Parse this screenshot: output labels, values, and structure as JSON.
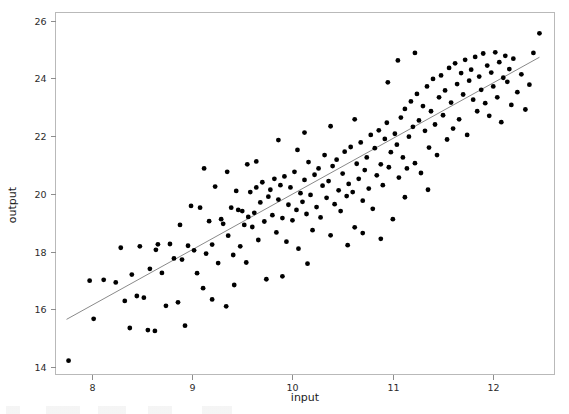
{
  "figure": {
    "width": 569,
    "height": 414,
    "background": "#ffffff",
    "point_color": "#000000",
    "line_color": "#8a8a8a",
    "frame_color": "#b9b9b9"
  },
  "chart_data": {
    "type": "scatter",
    "title": "",
    "xlabel": "input",
    "ylabel": "output",
    "xlim": [
      7.64,
      12.61
    ],
    "ylim": [
      13.74,
      26.28
    ],
    "xticks": [
      8,
      9,
      10,
      11,
      12
    ],
    "yticks": [
      14,
      16,
      18,
      20,
      22,
      24,
      26
    ],
    "xtick_labels": [
      "8",
      "9",
      "10",
      "11",
      "12"
    ],
    "ytick_labels": [
      "14",
      "16",
      "18",
      "20",
      "22",
      "24",
      "26"
    ],
    "grid": false,
    "legend": null,
    "n_points": 200,
    "fit_line": {
      "type": "linear",
      "x_start": 7.75,
      "y_start": 15.65,
      "x_end": 12.46,
      "y_end": 24.73,
      "slope": 1.929,
      "intercept": 0.705
    },
    "points": [
      [
        7.77,
        14.22
      ],
      [
        7.98,
        16.99
      ],
      [
        8.02,
        15.67
      ],
      [
        8.12,
        17.02
      ],
      [
        8.24,
        16.93
      ],
      [
        8.29,
        18.13
      ],
      [
        8.33,
        16.29
      ],
      [
        8.38,
        15.35
      ],
      [
        8.4,
        17.2
      ],
      [
        8.45,
        16.46
      ],
      [
        8.48,
        18.18
      ],
      [
        8.52,
        16.4
      ],
      [
        8.56,
        15.28
      ],
      [
        8.58,
        17.4
      ],
      [
        8.63,
        15.25
      ],
      [
        8.66,
        18.25
      ],
      [
        8.7,
        17.26
      ],
      [
        8.74,
        16.12
      ],
      [
        8.78,
        18.26
      ],
      [
        8.82,
        17.76
      ],
      [
        8.86,
        16.24
      ],
      [
        8.9,
        17.72
      ],
      [
        8.93,
        15.43
      ],
      [
        8.96,
        18.2
      ],
      [
        8.99,
        19.58
      ],
      [
        9.02,
        18.04
      ],
      [
        9.05,
        17.25
      ],
      [
        9.08,
        19.52
      ],
      [
        9.11,
        16.73
      ],
      [
        9.14,
        17.93
      ],
      [
        9.17,
        19.05
      ],
      [
        9.2,
        18.24
      ],
      [
        9.23,
        20.25
      ],
      [
        9.26,
        17.6
      ],
      [
        9.29,
        19.12
      ],
      [
        9.31,
        18.96
      ],
      [
        9.34,
        16.1
      ],
      [
        9.36,
        18.55
      ],
      [
        9.39,
        19.52
      ],
      [
        9.41,
        17.88
      ],
      [
        9.44,
        20.1
      ],
      [
        9.46,
        19.44
      ],
      [
        9.48,
        18.18
      ],
      [
        9.5,
        19.4
      ],
      [
        9.52,
        18.92
      ],
      [
        9.54,
        17.62
      ],
      [
        9.56,
        19.2
      ],
      [
        9.58,
        20.06
      ],
      [
        9.6,
        18.85
      ],
      [
        9.62,
        19.34
      ],
      [
        9.64,
        20.22
      ],
      [
        9.66,
        18.4
      ],
      [
        9.68,
        19.7
      ],
      [
        9.7,
        20.4
      ],
      [
        9.72,
        19.04
      ],
      [
        9.74,
        17.04
      ],
      [
        9.76,
        19.9
      ],
      [
        9.78,
        20.14
      ],
      [
        9.8,
        19.26
      ],
      [
        9.82,
        20.52
      ],
      [
        9.84,
        18.66
      ],
      [
        9.86,
        19.8
      ],
      [
        9.88,
        20.3
      ],
      [
        9.9,
        19.16
      ],
      [
        9.92,
        20.6
      ],
      [
        9.94,
        18.34
      ],
      [
        9.96,
        19.62
      ],
      [
        9.98,
        20.22
      ],
      [
        10.0,
        19.08
      ],
      [
        10.02,
        20.76
      ],
      [
        10.04,
        19.44
      ],
      [
        10.06,
        18.1
      ],
      [
        10.08,
        20.02
      ],
      [
        10.1,
        19.72
      ],
      [
        10.12,
        20.48
      ],
      [
        10.14,
        19.3
      ],
      [
        10.16,
        21.1
      ],
      [
        10.18,
        19.96
      ],
      [
        10.2,
        18.74
      ],
      [
        10.22,
        20.66
      ],
      [
        10.24,
        19.54
      ],
      [
        10.26,
        20.88
      ],
      [
        10.28,
        19.18
      ],
      [
        10.3,
        20.28
      ],
      [
        10.32,
        21.34
      ],
      [
        10.34,
        19.86
      ],
      [
        10.36,
        20.44
      ],
      [
        10.38,
        18.56
      ],
      [
        10.4,
        20.96
      ],
      [
        10.42,
        19.64
      ],
      [
        10.44,
        21.18
      ],
      [
        10.46,
        20.12
      ],
      [
        10.48,
        19.4
      ],
      [
        10.5,
        20.7
      ],
      [
        10.52,
        21.46
      ],
      [
        10.54,
        19.92
      ],
      [
        10.56,
        20.34
      ],
      [
        10.58,
        21.62
      ],
      [
        10.6,
        20.06
      ],
      [
        10.62,
        18.84
      ],
      [
        10.64,
        21.04
      ],
      [
        10.66,
        20.52
      ],
      [
        10.68,
        21.78
      ],
      [
        10.7,
        19.76
      ],
      [
        10.72,
        20.82
      ],
      [
        10.74,
        21.26
      ],
      [
        10.76,
        20.18
      ],
      [
        10.78,
        22.04
      ],
      [
        10.8,
        19.48
      ],
      [
        10.82,
        21.58
      ],
      [
        10.84,
        20.64
      ],
      [
        10.86,
        22.2
      ],
      [
        10.88,
        21.02
      ],
      [
        10.9,
        20.3
      ],
      [
        10.92,
        21.9
      ],
      [
        10.94,
        22.46
      ],
      [
        10.96,
        20.92
      ],
      [
        10.98,
        21.44
      ],
      [
        11.0,
        19.12
      ],
      [
        11.02,
        22.08
      ],
      [
        11.04,
        21.7
      ],
      [
        11.06,
        20.56
      ],
      [
        11.08,
        22.64
      ],
      [
        11.1,
        21.26
      ],
      [
        11.12,
        22.94
      ],
      [
        11.14,
        20.88
      ],
      [
        11.16,
        21.98
      ],
      [
        11.18,
        23.2
      ],
      [
        11.2,
        22.32
      ],
      [
        11.22,
        21.06
      ],
      [
        11.24,
        23.46
      ],
      [
        11.26,
        22.54
      ],
      [
        11.28,
        20.72
      ],
      [
        11.3,
        23.04
      ],
      [
        11.32,
        22.18
      ],
      [
        11.34,
        23.72
      ],
      [
        11.36,
        21.6
      ],
      [
        11.38,
        22.86
      ],
      [
        11.4,
        23.98
      ],
      [
        11.42,
        22.4
      ],
      [
        11.44,
        21.34
      ],
      [
        11.46,
        23.34
      ],
      [
        11.48,
        24.1
      ],
      [
        11.5,
        22.72
      ],
      [
        11.52,
        23.58
      ],
      [
        11.54,
        21.88
      ],
      [
        11.56,
        24.36
      ],
      [
        11.58,
        23.16
      ],
      [
        11.6,
        22.26
      ],
      [
        11.62,
        24.52
      ],
      [
        11.64,
        23.8
      ],
      [
        11.66,
        22.58
      ],
      [
        11.68,
        24.18
      ],
      [
        11.7,
        23.44
      ],
      [
        11.72,
        24.64
      ],
      [
        11.74,
        22.04
      ],
      [
        11.76,
        23.92
      ],
      [
        11.78,
        24.3
      ],
      [
        11.8,
        23.26
      ],
      [
        11.82,
        24.74
      ],
      [
        11.84,
        22.86
      ],
      [
        11.86,
        24.06
      ],
      [
        11.88,
        23.6
      ],
      [
        11.9,
        24.86
      ],
      [
        11.92,
        23.14
      ],
      [
        11.94,
        24.44
      ],
      [
        11.96,
        22.7
      ],
      [
        11.98,
        24.2
      ],
      [
        12.0,
        23.72
      ],
      [
        12.02,
        24.9
      ],
      [
        12.04,
        23.34
      ],
      [
        12.06,
        24.56
      ],
      [
        12.08,
        22.48
      ],
      [
        12.1,
        24.02
      ],
      [
        12.12,
        24.78
      ],
      [
        12.14,
        23.88
      ],
      [
        12.16,
        24.32
      ],
      [
        12.18,
        23.08
      ],
      [
        12.2,
        24.68
      ],
      [
        12.24,
        23.52
      ],
      [
        12.28,
        24.14
      ],
      [
        12.32,
        22.92
      ],
      [
        12.36,
        23.78
      ],
      [
        12.4,
        24.88
      ],
      [
        12.46,
        25.56
      ],
      [
        9.12,
        20.88
      ],
      [
        9.35,
        20.76
      ],
      [
        9.55,
        21.02
      ],
      [
        10.05,
        21.52
      ],
      [
        10.15,
        17.58
      ],
      [
        9.9,
        17.14
      ],
      [
        9.2,
        16.34
      ],
      [
        10.55,
        18.22
      ],
      [
        10.7,
        18.64
      ],
      [
        11.12,
        19.88
      ],
      [
        11.35,
        20.14
      ],
      [
        11.05,
        24.62
      ],
      [
        11.22,
        24.88
      ],
      [
        10.95,
        23.86
      ],
      [
        10.62,
        22.58
      ],
      [
        10.38,
        22.34
      ],
      [
        10.12,
        22.12
      ],
      [
        9.86,
        21.86
      ],
      [
        9.64,
        21.12
      ],
      [
        9.42,
        16.84
      ],
      [
        8.88,
        18.92
      ],
      [
        8.64,
        18.06
      ],
      [
        10.88,
        18.44
      ]
    ]
  },
  "axes": {
    "x_axis_name": "x-axis",
    "y_axis_name": "y-axis"
  }
}
